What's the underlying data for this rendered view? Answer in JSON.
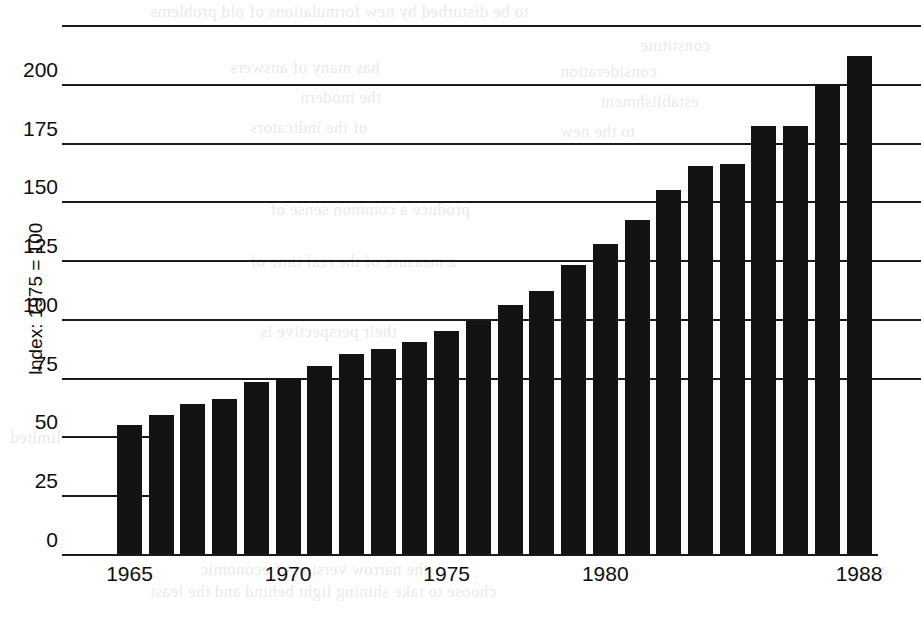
{
  "chart_data": {
    "type": "bar",
    "title": "",
    "subtitle": "",
    "xlabel": "",
    "ylabel": "Index: 1975 = 100",
    "categories": [
      "1965",
      "1966",
      "1967",
      "1968",
      "1969",
      "1970",
      "1971",
      "1972",
      "1973",
      "1974",
      "1975",
      "1976",
      "1977",
      "1978",
      "1979",
      "1980",
      "1981",
      "1982",
      "1983",
      "1984",
      "1985",
      "1986",
      "1987",
      "1988"
    ],
    "values": [
      55,
      59,
      64,
      66,
      73,
      75,
      80,
      85,
      87,
      90,
      95,
      99,
      106,
      112,
      123,
      132,
      142,
      155,
      165,
      166,
      182,
      182,
      200,
      212
    ],
    "series": [
      {
        "name": "Index: 1975 = 100",
        "values": [
          55,
          59,
          64,
          66,
          73,
          75,
          80,
          85,
          87,
          90,
          95,
          99,
          106,
          112,
          123,
          132,
          142,
          155,
          165,
          166,
          182,
          182,
          200,
          212
        ]
      }
    ],
    "ylim": [
      0,
      225
    ],
    "yticks": [
      0,
      25,
      50,
      75,
      100,
      125,
      150,
      175,
      200
    ],
    "ytick_labels": [
      "0",
      "25",
      "50",
      "75",
      "100",
      "125",
      "150",
      "175",
      "200"
    ],
    "xtick_labels": [
      "1965",
      "1970",
      "1975",
      "1980",
      "1988"
    ],
    "xtick_categories": [
      "1965",
      "1970",
      "1975",
      "1980",
      "1988"
    ],
    "grid": true,
    "grid_axis": "y",
    "legend": false,
    "legend_position": "none",
    "bar_color": "#131313",
    "axis_color": "#1a1a1a",
    "background_color": "#ffffff"
  },
  "bleed_text": [
    {
      "text": "to be disturbed by new formulations of old problems",
      "x": 150,
      "y": 2
    },
    {
      "text": "constitute",
      "x": 640,
      "y": 36
    },
    {
      "text": "has many of answers",
      "x": 230,
      "y": 58
    },
    {
      "text": "consideration",
      "x": 560,
      "y": 62
    },
    {
      "text": "the modern",
      "x": 300,
      "y": 88
    },
    {
      "text": "establishment",
      "x": 600,
      "y": 92
    },
    {
      "text": "of the indicators",
      "x": 250,
      "y": 118
    },
    {
      "text": "to the new",
      "x": 560,
      "y": 122
    },
    {
      "text": "produce a common sense of",
      "x": 270,
      "y": 200
    },
    {
      "text": "a measure of the real time of",
      "x": 250,
      "y": 252
    },
    {
      "text": "their perspective is",
      "x": 260,
      "y": 322
    },
    {
      "text": "limited",
      "x": 10,
      "y": 428
    },
    {
      "text": "the narrow version of economic",
      "x": 200,
      "y": 560
    },
    {
      "text": "choose to take shining light behind and the least",
      "x": 150,
      "y": 582
    },
    {
      "text": "a",
      "x": 880,
      "y": 560
    }
  ]
}
